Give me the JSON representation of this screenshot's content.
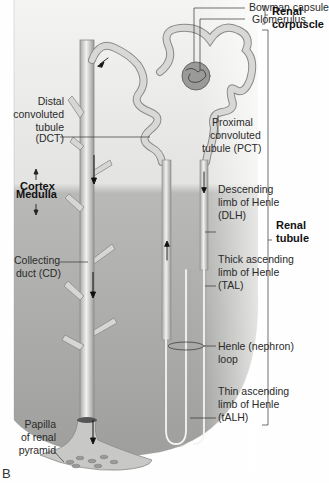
{
  "figure": {
    "panel_label": "B",
    "colors": {
      "cortex_bg": "#ececea",
      "medulla_bg": "#a8a8a6",
      "tubule_fill": "#d4d4d2",
      "tubule_stroke": "#8a8a88",
      "label_text": "#2a2a2a",
      "leader_line": "#333333"
    }
  },
  "regions": {
    "cortex": "Cortex",
    "medulla": "Medulla"
  },
  "labels": {
    "bowman_capsule": "Bowman capsule",
    "glomerulus": "Glomerulus",
    "renal_corpuscle_line1": "Renal",
    "renal_corpuscle_line2": "corpuscle",
    "dct_line1": "Distal",
    "dct_line2": "convoluted",
    "dct_line3": "tubule",
    "dct_line4": "(DCT)",
    "pct_line1": "Proximal",
    "pct_line2": "convoluted",
    "pct_line3": "tubule (PCT)",
    "dlh_line1": "Descending",
    "dlh_line2": "limb of Henle",
    "dlh_line3": "(DLH)",
    "renal_tubule_line1": "Renal",
    "renal_tubule_line2": "tubule",
    "cd_line1": "Collecting",
    "cd_line2": "duct (CD)",
    "tal_line1": "Thick ascending",
    "tal_line2": "limb of Henle",
    "tal_line3": "(TAL)",
    "loop_line1": "Henle (nephron)",
    "loop_line2": "loop",
    "talh_line1": "Thin ascending",
    "talh_line2": "limb of Henle",
    "talh_line3": "(tALH)",
    "papilla_line1": "Papilla",
    "papilla_line2": "of renal",
    "papilla_line3": "pyramid"
  }
}
